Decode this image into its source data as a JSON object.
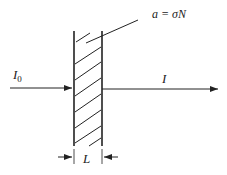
{
  "labels": {
    "absorption": "a = σN",
    "incident": "I",
    "incident_sub": "0",
    "transmitted": "I",
    "thickness": "L"
  },
  "colors": {
    "stroke": "#222222",
    "background": "#ffffff"
  }
}
